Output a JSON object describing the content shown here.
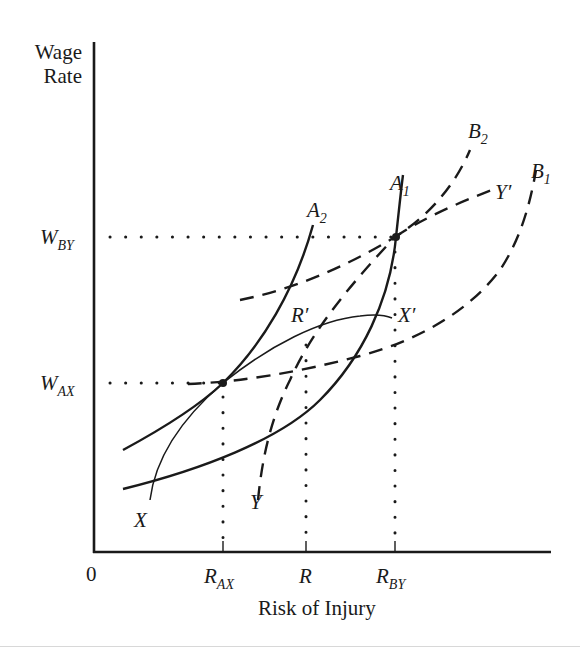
{
  "diagram": {
    "y_axis_label_line1": "Wage",
    "y_axis_label_line2": "Rate",
    "x_axis_label": "Risk of Injury",
    "origin_label": "0",
    "y_ticks": [
      {
        "main": "W",
        "sub": "BY"
      },
      {
        "main": "W",
        "sub": "AX"
      }
    ],
    "x_ticks": [
      {
        "main": "R",
        "sub": "AX"
      },
      {
        "main": "R",
        "sub": ""
      },
      {
        "main": "R",
        "sub": "BY"
      }
    ],
    "curve_labels": {
      "A1": {
        "main": "A",
        "sub": "1"
      },
      "A2": {
        "main": "A",
        "sub": "2"
      },
      "B1": {
        "main": "B",
        "sub": "1"
      },
      "B2": {
        "main": "B",
        "sub": "2"
      },
      "X": "X",
      "X_prime": "X′",
      "Y": "Y",
      "Y_prime": "Y′",
      "R_prime": "R′"
    },
    "curves": [
      {
        "name": "A1",
        "style": "solid",
        "description": "Employer A isoprofit (upper-right), steeper"
      },
      {
        "name": "A2",
        "style": "solid",
        "description": "Employer A isoprofit (left)"
      },
      {
        "name": "B1",
        "style": "dashed",
        "description": "Employer B isoprofit (lower)"
      },
      {
        "name": "B2",
        "style": "dashed",
        "description": "Employer B isoprofit (upper)"
      },
      {
        "name": "X-X'",
        "style": "thin solid",
        "description": "Worker X indifference curve"
      },
      {
        "name": "Y-Y'",
        "style": "dashed",
        "description": "Worker Y indifference curve"
      }
    ]
  }
}
